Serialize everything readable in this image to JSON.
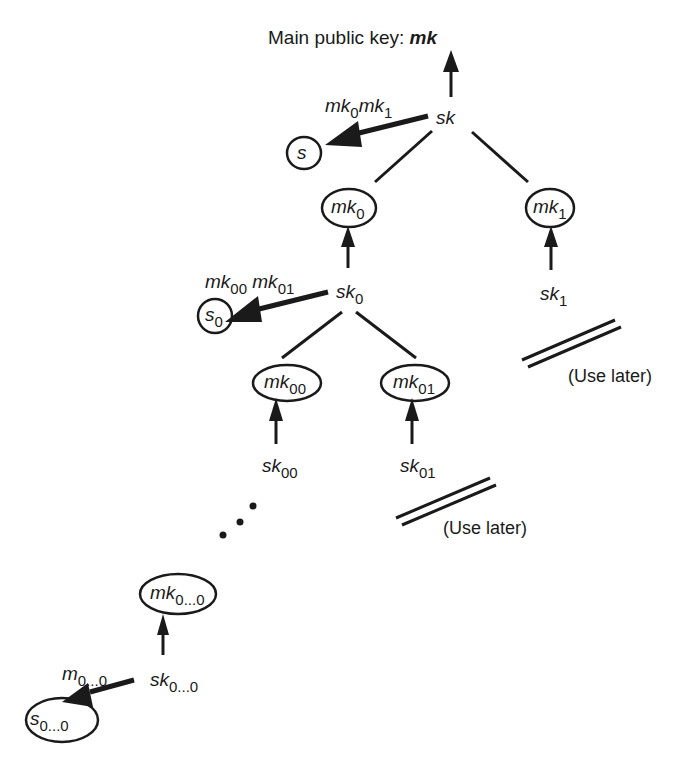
{
  "diagram": {
    "title_prefix": "Main public key: ",
    "title_key": "mk",
    "nodes": {
      "sk": {
        "base": "sk",
        "sub": ""
      },
      "s": {
        "base": "s",
        "sub": ""
      },
      "s_label": {
        "base1": "mk",
        "sub1": "0",
        "base2": "mk",
        "sub2": "1"
      },
      "mk0": {
        "base": "mk",
        "sub": "0"
      },
      "mk1": {
        "base": "mk",
        "sub": "1"
      },
      "sk0": {
        "base": "sk",
        "sub": "0"
      },
      "sk1": {
        "base": "sk",
        "sub": "1"
      },
      "s0": {
        "base": "s",
        "sub": "0"
      },
      "s0_label": {
        "base1": "mk",
        "sub1": "00",
        "base2": "mk",
        "sub2": "01"
      },
      "mk00": {
        "base": "mk",
        "sub": "00"
      },
      "mk01": {
        "base": "mk",
        "sub": "01"
      },
      "sk00": {
        "base": "sk",
        "sub": "00"
      },
      "sk01": {
        "base": "sk",
        "sub": "01"
      },
      "mk0n": {
        "base": "mk",
        "sub": "0...0"
      },
      "sk0n": {
        "base": "sk",
        "sub": "0...0"
      },
      "s0n": {
        "base": "s",
        "sub": "0...0"
      },
      "s0n_label": {
        "base": "m",
        "sub": "0...0"
      }
    },
    "notes": {
      "use_later_1": "(Use later)",
      "use_later_2": "(Use later)"
    },
    "colors": {
      "ink": "#1a1a1a",
      "background": "#ffffff"
    }
  }
}
